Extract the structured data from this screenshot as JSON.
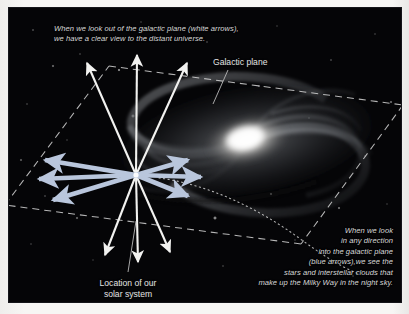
{
  "figure": {
    "kind": "astronomy-diagram",
    "background_color": "#050507",
    "border_color": "#f4f3f1"
  },
  "captions": {
    "top": "When we look out of the galactic plane (white arrows),\nwe have a clear view to the distant universe.",
    "bottom_right": "When we look\nin any direction\ninto the galactic plane\n(blue arrows),we see the\nstars and interstellar clouds that\nmake up the Milky Way in the night sky."
  },
  "labels": {
    "galactic_plane": "Galactic plane",
    "solar_system": "Location of our\nsolar system"
  },
  "colors": {
    "white_arrow": "#f2f2f0",
    "blue_arrow": "#b9c6dc",
    "dashed_plane_line": "#d5d5d5",
    "dotted_orbit_line": "#cfcfcf",
    "leader_line": "#b9b9b9",
    "galaxy_core": "#ffffff",
    "galaxy_disk": "#9aa0a8",
    "caption_text": "#d8d8d8",
    "label_text": "#e4e4e4"
  },
  "geometry": {
    "sun_position": {
      "x": 127,
      "y": 167
    },
    "galaxy_core": {
      "x": 238,
      "y": 133
    },
    "plane_parallelogram": [
      {
        "x": 100,
        "y": 58
      },
      {
        "x": 394,
        "y": 97
      },
      {
        "x": 292,
        "y": 236
      },
      {
        "x": -4,
        "y": 197
      }
    ],
    "white_arrow_tips": [
      {
        "x": 76,
        "y": 52
      },
      {
        "x": 128,
        "y": 44
      },
      {
        "x": 179,
        "y": 52
      },
      {
        "x": 94,
        "y": 250
      },
      {
        "x": 129,
        "y": 257
      },
      {
        "x": 163,
        "y": 247
      }
    ],
    "blue_arrow_tips": [
      {
        "x": 29,
        "y": 150
      },
      {
        "x": 22,
        "y": 172
      },
      {
        "x": 36,
        "y": 194
      },
      {
        "x": 186,
        "y": 150
      },
      {
        "x": 199,
        "y": 170
      },
      {
        "x": 186,
        "y": 190
      }
    ]
  },
  "annotations": {
    "white_arrow_count": 6,
    "blue_arrow_count": 6,
    "white_arrow_meaning": "lines of sight out of the galactic plane",
    "blue_arrow_meaning": "lines of sight into the galactic plane"
  }
}
